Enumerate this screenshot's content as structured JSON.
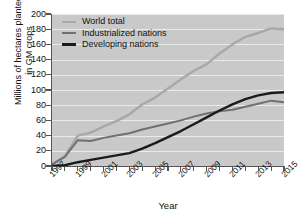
{
  "chart_data": {
    "type": "line",
    "title": "",
    "xlabel": "Year",
    "ylabel": "Millions of hectares planted in GM crops",
    "ylabel_lines": [
      "Millions of hectares planted",
      "in GM crops"
    ],
    "xlim": [
      1997,
      2015
    ],
    "ylim": [
      0,
      200
    ],
    "yticks": [
      0,
      20,
      40,
      60,
      80,
      100,
      120,
      140,
      160,
      180,
      200
    ],
    "xticks": [
      1997,
      1998,
      1999,
      2000,
      2001,
      2002,
      2003,
      2004,
      2005,
      2006,
      2007,
      2008,
      2009,
      2010,
      2011,
      2012,
      2013,
      2014,
      2015
    ],
    "xticklabels": [
      "1997",
      "",
      "1999",
      "",
      "2001",
      "",
      "2003",
      "",
      "2005",
      "",
      "2007",
      "",
      "2009",
      "",
      "2011",
      "",
      "2013",
      "",
      "2015"
    ],
    "xticklabels_shown": [
      "1997",
      "1999",
      "2001",
      "2003",
      "2005",
      "2007",
      "2009",
      "2011",
      "2013",
      "2015"
    ],
    "grid": "horizontal",
    "grid_color": "#eaeaea",
    "plot_background": "#c9c9c9",
    "legend_position": "top-left",
    "x": [
      1997,
      1998,
      1999,
      2000,
      2001,
      2002,
      2003,
      2004,
      2005,
      2006,
      2007,
      2008,
      2009,
      2010,
      2011,
      2012,
      2013,
      2014,
      2015
    ],
    "series": [
      {
        "name": "World total",
        "color": "#a8a8a8",
        "width": 2.4,
        "values": [
          2,
          13,
          40,
          44,
          52,
          59,
          68,
          81,
          90,
          102,
          114,
          125,
          134,
          148,
          160,
          170,
          175,
          181,
          180
        ]
      },
      {
        "name": "Industrialized nations",
        "color": "#707070",
        "width": 2.0,
        "values": [
          2,
          12,
          34,
          33,
          37,
          40,
          43,
          48,
          52,
          56,
          60,
          65,
          69,
          72,
          74,
          78,
          82,
          86,
          84
        ]
      },
      {
        "name": "Developing nations",
        "color": "#1a1a1a",
        "width": 2.4,
        "values": [
          0,
          1,
          5,
          8,
          11,
          14,
          17,
          23,
          30,
          38,
          46,
          55,
          64,
          73,
          81,
          88,
          93,
          96,
          97
        ]
      }
    ]
  },
  "legend": {
    "items": [
      {
        "label": "World total",
        "color": "#a8a8a8",
        "thickness": "2.6px"
      },
      {
        "label": "Industrialized nations",
        "color": "#707070",
        "thickness": "2.4px"
      },
      {
        "label": "Developing nations",
        "color": "#1a1a1a",
        "thickness": "3.2px"
      }
    ]
  }
}
